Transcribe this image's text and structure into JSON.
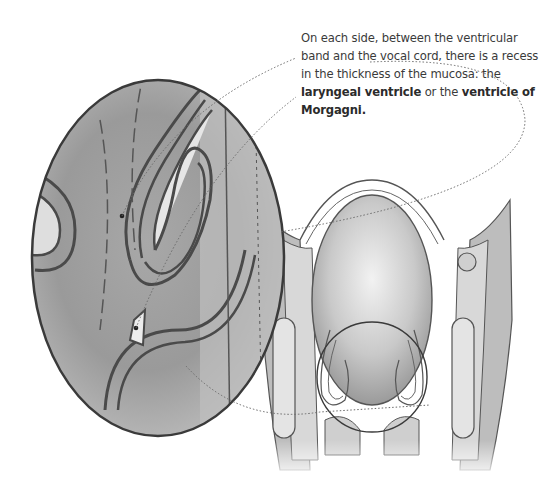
{
  "caption": {
    "part1": "On each side, between the ventricular band and the vocal cord, there is a recess in the thickness of the mucosa: the ",
    "term1": "laryngeal ventricle",
    "part2": " or the ",
    "term2": "ventricle of Morgagni."
  },
  "figure": {
    "magnified_region": "laryngeal-ventricle",
    "colors": {
      "outline": "#4a4a4a",
      "tissue_dark": "#8c8c8c",
      "tissue_light": "#d6d6d6",
      "background": "#ffffff",
      "leader_line": "#6a6a6a"
    }
  }
}
